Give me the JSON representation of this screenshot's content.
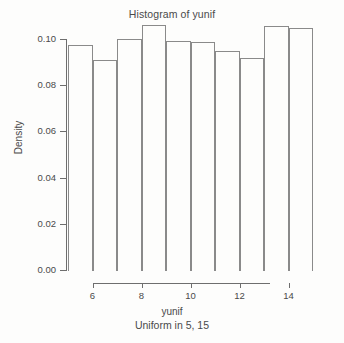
{
  "chart_data": {
    "type": "bar",
    "title": "Histogram of yunif",
    "xlabel": "yunif",
    "sublabel": "Uniform in 5, 15",
    "ylabel": "Density",
    "grid": false,
    "legend": "none",
    "xlim": [
      5,
      15
    ],
    "ylim": [
      0.0,
      0.11
    ],
    "bin_width": 1,
    "bin_edges": [
      5,
      6,
      7,
      8,
      9,
      10,
      11,
      12,
      13,
      14,
      15
    ],
    "categories": [
      "5-6",
      "6-7",
      "7-8",
      "8-9",
      "9-10",
      "10-11",
      "11-12",
      "12-13",
      "13-14",
      "14-15"
    ],
    "values": [
      0.098,
      0.0915,
      0.1005,
      0.1065,
      0.0995,
      0.0993,
      0.0952,
      0.0922,
      0.106,
      0.105
    ],
    "xticks": [
      {
        "value": 6,
        "label": "6"
      },
      {
        "value": 8,
        "label": "8"
      },
      {
        "value": 10,
        "label": "10"
      },
      {
        "value": 12,
        "label": "12"
      },
      {
        "value": 14,
        "label": "14"
      }
    ],
    "yticks": [
      {
        "value": 0.0,
        "label": "0.00"
      },
      {
        "value": 0.02,
        "label": "0.02"
      },
      {
        "value": 0.04,
        "label": "0.04"
      },
      {
        "value": 0.06,
        "label": "0.06"
      },
      {
        "value": 0.08,
        "label": "0.08"
      },
      {
        "value": 0.1,
        "label": "0.10"
      }
    ],
    "colors": {
      "bar_border": "#8a8a8a",
      "bar_fill": "transparent",
      "axis": "#6e6e6e",
      "text": "#4a4a4a",
      "background": "#fdfdfc"
    }
  }
}
